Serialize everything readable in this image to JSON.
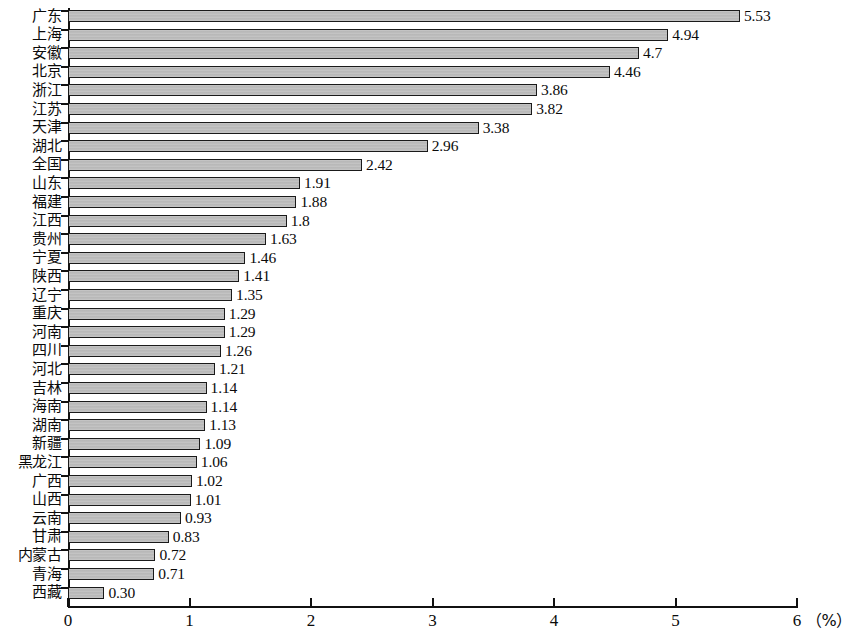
{
  "chart_data": {
    "type": "bar",
    "orientation": "horizontal",
    "title": "",
    "subtitle": "",
    "xlabel": "(%)",
    "ylabel": "",
    "xlim": [
      0,
      6
    ],
    "xticks": [
      "0",
      "1",
      "2",
      "3",
      "4",
      "5",
      "6"
    ],
    "grid": false,
    "legend": null,
    "bar_color": "#bdbdbd",
    "bar_border_color": "#1a1a1a",
    "axis_color": "#111111",
    "unit_label": "（%）",
    "categories": [
      "广东",
      "上海",
      "安徽",
      "北京",
      "浙江",
      "江苏",
      "天津",
      "湖北",
      "全国",
      "山东",
      "福建",
      "江西",
      "贵州",
      "宁夏",
      "陕西",
      "辽宁",
      "重庆",
      "河南",
      "四川",
      "河北",
      "吉林",
      "海南",
      "湖南",
      "新疆",
      "黑龙江",
      "广西",
      "山西",
      "云南",
      "甘肃",
      "内蒙古",
      "青海",
      "西藏"
    ],
    "values": [
      5.53,
      4.94,
      4.7,
      4.46,
      3.86,
      3.82,
      3.38,
      2.96,
      2.42,
      1.91,
      1.88,
      1.8,
      1.63,
      1.46,
      1.41,
      1.35,
      1.29,
      1.29,
      1.26,
      1.21,
      1.14,
      1.14,
      1.13,
      1.09,
      1.06,
      1.02,
      1.01,
      0.93,
      0.83,
      0.72,
      0.71,
      0.3
    ],
    "value_labels": [
      "5.53",
      "4.94",
      "4.7",
      "4.46",
      "3.86",
      "3.82",
      "3.38",
      "2.96",
      "2.42",
      "1.91",
      "1.88",
      "1.8",
      "1.63",
      "1.46",
      "1.41",
      "1.35",
      "1.29",
      "1.29",
      "1.26",
      "1.21",
      "1.14",
      "1.14",
      "1.13",
      "1.09",
      "1.06",
      "1.02",
      "1.01",
      "0.93",
      "0.83",
      "0.72",
      "0.71",
      "0.30"
    ]
  }
}
